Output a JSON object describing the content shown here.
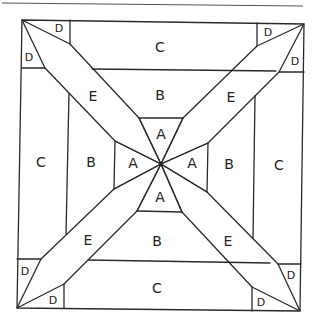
{
  "diagram": {
    "type": "quilt-block-pattern",
    "piece_labels": {
      "a": "A",
      "b": "B",
      "c": "C",
      "d": "D",
      "e": "E"
    },
    "labels": {
      "c_top": "C",
      "c_bottom": "C",
      "c_left": "C",
      "c_right": "C",
      "b_top": "B",
      "b_bottom": "B",
      "b_left": "B",
      "b_right": "B",
      "a_top": "A",
      "a_bottom": "A",
      "a_left": "A",
      "a_right": "A",
      "e_tl": "E",
      "e_tr": "E",
      "e_bl": "E",
      "e_br": "E",
      "d_tl_top": "D",
      "d_tl_left": "D",
      "d_tr_top": "D",
      "d_tr_right": "D",
      "d_bl_left": "D",
      "d_bl_bottom": "D",
      "d_br_right": "D",
      "d_br_bottom": "D"
    }
  }
}
